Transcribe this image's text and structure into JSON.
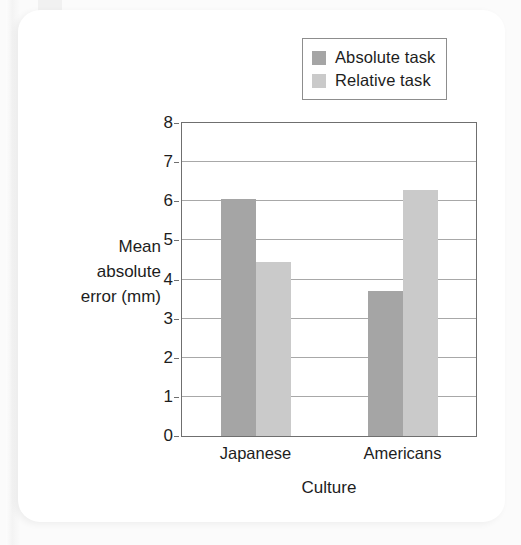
{
  "chart_data": {
    "type": "bar",
    "title": "",
    "xlabel": "Culture",
    "ylabel": "Mean absolute error (mm)",
    "ylabel_lines": [
      "Mean",
      "absolute",
      "error (mm)"
    ],
    "categories": [
      "Japanese",
      "Americans"
    ],
    "series": [
      {
        "name": "Absolute task",
        "color": "#a5a5a5",
        "values": [
          6.05,
          3.7
        ]
      },
      {
        "name": "Relative task",
        "color": "#cacaca",
        "values": [
          4.45,
          6.3
        ]
      }
    ],
    "ylim": [
      0,
      8
    ],
    "yticks": [
      0,
      1,
      2,
      3,
      4,
      5,
      6,
      7,
      8
    ],
    "ytick_labels": [
      "0",
      "1",
      "2",
      "3",
      "4",
      "5",
      "6",
      "7",
      "8"
    ],
    "grid": true,
    "grid_axis": "y",
    "legend_position": "top-right",
    "legend_entries": [
      "Absolute task",
      "Relative task"
    ],
    "frame_color": "#6f6f6f",
    "grid_color": "#a8a8a8",
    "background": "#ffffff"
  }
}
